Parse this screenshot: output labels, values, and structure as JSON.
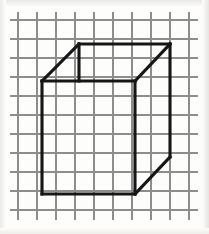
{
  "figure": {
    "background_color": "#fdfdfc",
    "canvas": {
      "width": 209,
      "height": 234
    }
  },
  "grid": {
    "name": "graph-paper-grid",
    "line_color": "#8d8d8d",
    "line_width": 1.1,
    "spacing_px": 19,
    "vertical_x": [
      18,
      37,
      56,
      75,
      94,
      113,
      132,
      151,
      170,
      189
    ],
    "horizontal_y": [
      20,
      39,
      58,
      77,
      96,
      115,
      134,
      153,
      172,
      191,
      210
    ],
    "extent": {
      "x_min": 10,
      "x_max": 198,
      "y_min": 12,
      "y_max": 220
    },
    "columns": 9,
    "rows": 10
  },
  "cube": {
    "name": "wireframe-cube",
    "stroke_color": "#161616",
    "stroke_width": 3.1,
    "projection": "oblique",
    "offset_px": {
      "dx": 36,
      "dy": -37
    },
    "vertices": {
      "front_top_left": [
        42,
        81
      ],
      "front_top_right": [
        135,
        81
      ],
      "front_bottom_right": [
        135,
        194
      ],
      "front_bottom_left": [
        42,
        194
      ],
      "back_top_left": [
        79,
        44
      ],
      "back_top_right": [
        170,
        44
      ],
      "back_bottom_right": [
        170,
        157
      ],
      "back_bottom_left": [
        79,
        157
      ]
    },
    "edges": [
      {
        "name": "front-top",
        "from": "front_top_left",
        "to": "front_top_right",
        "style": "solid",
        "visible": true
      },
      {
        "name": "front-right",
        "from": "front_top_right",
        "to": "front_bottom_right",
        "style": "solid",
        "visible": true
      },
      {
        "name": "front-bottom",
        "from": "front_bottom_right",
        "to": "front_bottom_left",
        "style": "solid",
        "visible": true
      },
      {
        "name": "front-left",
        "from": "front_bottom_left",
        "to": "front_top_left",
        "style": "solid",
        "visible": true
      },
      {
        "name": "connector-top-left",
        "from": "front_top_left",
        "to": "back_top_left",
        "style": "solid",
        "visible": true
      },
      {
        "name": "connector-top-right",
        "from": "front_top_right",
        "to": "back_top_right",
        "style": "solid",
        "visible": true
      },
      {
        "name": "connector-bottom-right",
        "from": "front_bottom_right",
        "to": "back_bottom_right",
        "style": "solid",
        "visible": true
      },
      {
        "name": "back-top",
        "from": "back_top_left",
        "to": "back_top_right",
        "style": "solid",
        "visible": true
      },
      {
        "name": "back-right",
        "from": "back_top_right",
        "to": "back_bottom_right",
        "style": "solid",
        "visible": true
      },
      {
        "name": "back-left-stub",
        "from": "back_top_left",
        "to": [
          79,
          81
        ],
        "style": "solid",
        "visible": true
      }
    ],
    "paths": {
      "front_face": "M 42 81 L 135 81 L 135 194 L 42 194 Z",
      "top_left_connector": "M 42 81 L 79 44",
      "top_right_connector": "M 135 81 L 170 44",
      "bottom_right_connector": "M 135 194 L 170 157",
      "back_top_edge": "M 79 44 L 170 44",
      "back_right_edge": "M 170 44 L 170 157",
      "back_left_stub": "M 79 44 L 79 81"
    }
  }
}
